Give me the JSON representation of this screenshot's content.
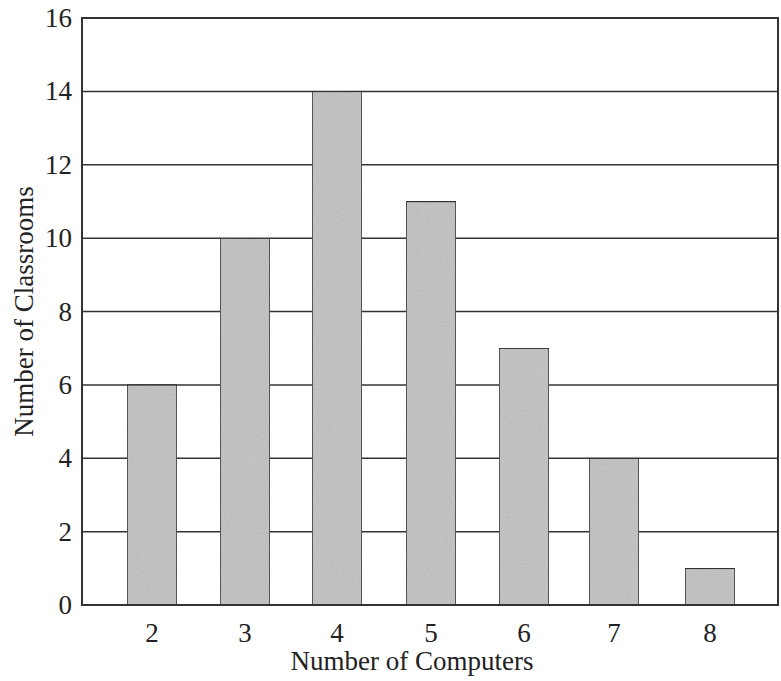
{
  "chart_data": {
    "type": "bar",
    "title": "",
    "xlabel": "Number of Computers",
    "ylabel": "Number of Classrooms",
    "categories": [
      "2",
      "3",
      "4",
      "5",
      "6",
      "7",
      "8"
    ],
    "values": [
      6,
      10,
      14,
      11,
      7,
      4,
      1
    ],
    "ylim": [
      0,
      16
    ],
    "yticks": [
      "0",
      "2",
      "4",
      "6",
      "8",
      "10",
      "12",
      "14",
      "16"
    ],
    "grid": true,
    "legend": "none",
    "colors": {
      "bar_fill": "#c8c8c8",
      "bar_stroke": "#333333",
      "grid": "#333333",
      "frame": "#333333"
    }
  }
}
